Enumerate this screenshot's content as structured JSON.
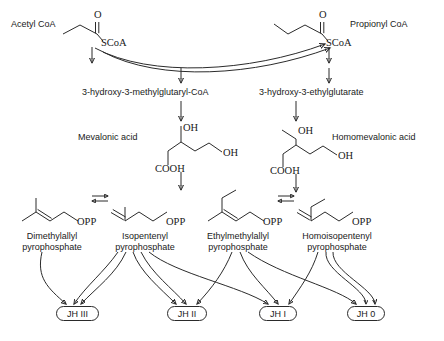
{
  "diagram": {
    "background_color": "#ffffff",
    "line_color": "#2b2b2b",
    "text_color": "#1a1a1a"
  },
  "precursors": [
    {
      "name": "acetyl-coa",
      "label": "Acetyl CoA",
      "oxygen": "O",
      "thioester": "SCoA"
    },
    {
      "name": "propionyl-coa",
      "label": "Propionyl CoA",
      "oxygen": "O",
      "thioester": "SCoA"
    }
  ],
  "intermediates": [
    {
      "name": "hmg-coa",
      "label": "3-hydroxy-3-methylglutaryl-CoA"
    },
    {
      "name": "heg",
      "label": "3-hydroxy-3-ethylglutarate"
    }
  ],
  "acids": [
    {
      "name": "mevalonic-acid",
      "label": "Mevalonic acid",
      "hydroxyl_top": "OH",
      "hydroxyl_right": "OH",
      "carboxyl": "COOH"
    },
    {
      "name": "homomevalonic-acid",
      "label": "Homomevalonic acid",
      "hydroxyl_top": "OH",
      "hydroxyl_right": "OH",
      "carboxyl": "COOH"
    }
  ],
  "pyrophosphates": [
    {
      "name": "dimethylallyl-pyrophosphate",
      "line1": "Dimethylallyl",
      "line2": "pyrophosphate",
      "group": "OPP"
    },
    {
      "name": "isopentenyl-pyrophosphate",
      "line1": "Isopentenyl",
      "line2": "pyrophosphate",
      "group": "OPP"
    },
    {
      "name": "ethylmethylallyl-pyrophosphate",
      "line1": "Ethylmethylallyl",
      "line2": "pyrophosphate",
      "group": "OPP"
    },
    {
      "name": "homoisopentenyl-pyrophosphate",
      "line1": "Homoisopentenyl",
      "line2": "pyrophosphate",
      "group": "OPP"
    }
  ],
  "products": [
    {
      "name": "jh-iii",
      "label": "JH III"
    },
    {
      "name": "jh-ii",
      "label": "JH II"
    },
    {
      "name": "jh-i",
      "label": "JH I"
    },
    {
      "name": "jh-0",
      "label": "JH 0"
    }
  ]
}
